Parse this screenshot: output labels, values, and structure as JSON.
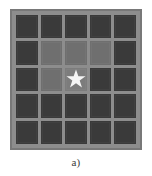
{
  "figure": {
    "caption": "а)",
    "panel": {
      "name": "cellular-grid",
      "rows": 5,
      "cols": 5,
      "background_color": "#8d8d8d",
      "border_color": "#787878"
    },
    "legend_colors": {
      "dark_cell": "#3a3a3a",
      "medium_cell": "#6f6f6f",
      "light_cell": "#7c7c7c",
      "star_fill": "#f4f4f4",
      "page_background": "#ffffff"
    },
    "marker": {
      "shape": "star",
      "points": 5,
      "fill": "#f4f4f4",
      "row": 3,
      "col": 3
    },
    "cells": [
      [
        {
          "id": "r1c1",
          "state": "dark",
          "star": false
        },
        {
          "id": "r1c2",
          "state": "dark",
          "star": false
        },
        {
          "id": "r1c3",
          "state": "dark",
          "star": false
        },
        {
          "id": "r1c4",
          "state": "dark",
          "star": false
        },
        {
          "id": "r1c5",
          "state": "dark",
          "star": false
        }
      ],
      [
        {
          "id": "r2c1",
          "state": "dark",
          "star": false
        },
        {
          "id": "r2c2",
          "state": "medium",
          "star": false
        },
        {
          "id": "r2c3",
          "state": "medium",
          "star": false
        },
        {
          "id": "r2c4",
          "state": "medium",
          "star": false
        },
        {
          "id": "r2c5",
          "state": "dark",
          "star": false
        }
      ],
      [
        {
          "id": "r3c1",
          "state": "dark",
          "star": false
        },
        {
          "id": "r3c2",
          "state": "medium",
          "star": false
        },
        {
          "id": "r3c3",
          "state": "light",
          "star": true
        },
        {
          "id": "r3c4",
          "state": "dark",
          "star": false
        },
        {
          "id": "r3c5",
          "state": "dark",
          "star": false
        }
      ],
      [
        {
          "id": "r4c1",
          "state": "dark",
          "star": false
        },
        {
          "id": "r4c2",
          "state": "dark",
          "star": false
        },
        {
          "id": "r4c3",
          "state": "dark",
          "star": false
        },
        {
          "id": "r4c4",
          "state": "dark",
          "star": false
        },
        {
          "id": "r4c5",
          "state": "dark",
          "star": false
        }
      ],
      [
        {
          "id": "r5c1",
          "state": "dark",
          "star": false
        },
        {
          "id": "r5c2",
          "state": "dark",
          "star": false
        },
        {
          "id": "r5c3",
          "state": "dark",
          "star": false
        },
        {
          "id": "r5c4",
          "state": "dark",
          "star": false
        },
        {
          "id": "r5c5",
          "state": "dark",
          "star": false
        }
      ]
    ]
  }
}
